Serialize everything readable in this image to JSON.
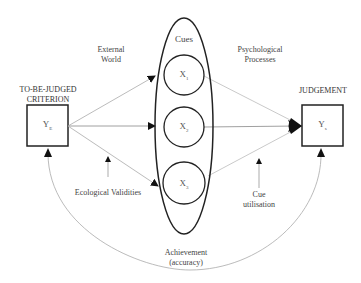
{
  "diagram": {
    "criterion": {
      "header_line1": "TO-BE-JUDGED",
      "header_line2": "CRITERION",
      "variable": "Y",
      "subscript": "E"
    },
    "judgement": {
      "header": "JUDGEMENT",
      "variable": "Y",
      "subscript": "s"
    },
    "cues": {
      "label": "Cues",
      "items": [
        {
          "variable": "X",
          "subscript": "1"
        },
        {
          "variable": "X",
          "subscript": "2"
        },
        {
          "variable": "X",
          "subscript": "3"
        }
      ]
    },
    "labels": {
      "external_world_line1": "External",
      "external_world_line2": "World",
      "psych_line1": "Psychological",
      "psych_line2": "Processes",
      "ecological": "Ecological Validities",
      "cue_util_line1": "Cue",
      "cue_util_line2": "utilisation",
      "achievement_line1": "Achievement",
      "achievement_line2": "(accuracy)"
    },
    "colors": {
      "stroke_dark": "#222222",
      "stroke_light": "#aaaaaa",
      "background": "#ffffff"
    }
  }
}
